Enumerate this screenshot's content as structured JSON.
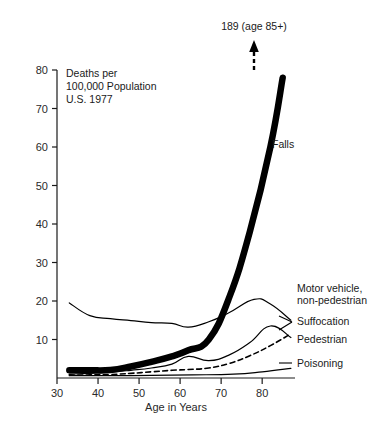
{
  "chart_data": {
    "type": "line",
    "title": "",
    "note_lines": [
      "Deaths  per",
      "100,000 Population",
      "U.S.  1977"
    ],
    "xlabel": "Age in Years",
    "ylabel": "",
    "xlim": [
      30,
      88
    ],
    "ylim": [
      0,
      80
    ],
    "xticks": [
      30,
      40,
      50,
      60,
      70,
      80
    ],
    "yticks": [
      10,
      20,
      30,
      40,
      50,
      60,
      70,
      80
    ],
    "grid": false,
    "legend_position": "right-inline",
    "annotations": [
      {
        "text": "189 (age 85+)",
        "x": 85,
        "y": 95,
        "kind": "arrow-callout"
      }
    ],
    "series": [
      {
        "name": "Falls",
        "style": "thick-solid",
        "label": "Falls",
        "x": [
          33,
          38,
          43,
          48,
          53,
          58,
          62,
          67,
          72,
          77,
          82,
          85
        ],
        "values": [
          2.0,
          2.0,
          2.1,
          3.0,
          4.2,
          5.6,
          7.2,
          10.0,
          21.0,
          38.0,
          60.0,
          78.0
        ]
      },
      {
        "name": "Motor vehicle, non-pedestrian",
        "style": "thin-solid",
        "label": "Motor vehicle,\nnon-pedestrian",
        "label_line1": "Motor  vehicle,",
        "label_line2": "non-pedestrian",
        "x": [
          33,
          38,
          43,
          48,
          53,
          58,
          62,
          67,
          72,
          78,
          82,
          87
        ],
        "values": [
          19.5,
          16.2,
          15.4,
          14.9,
          14.4,
          14.2,
          13.2,
          14.6,
          17.0,
          20.4,
          19.2,
          15.0
        ]
      },
      {
        "name": "Suffocation",
        "style": "thin-solid",
        "label": "Suffocation",
        "x": [
          33,
          38,
          43,
          48,
          53,
          58,
          62,
          67,
          72,
          77,
          82,
          87
        ],
        "values": [
          1.0,
          1.2,
          1.5,
          2.0,
          2.6,
          3.6,
          5.6,
          4.5,
          6.0,
          9.2,
          13.5,
          10.5
        ]
      },
      {
        "name": "Pedestrian",
        "style": "dashed",
        "label": "Pedestrian",
        "x": [
          33,
          38,
          43,
          48,
          53,
          58,
          62,
          67,
          72,
          77,
          82,
          87
        ],
        "values": [
          0.8,
          0.8,
          0.9,
          1.2,
          1.6,
          2.0,
          2.2,
          2.6,
          3.8,
          5.8,
          8.4,
          11.5
        ]
      },
      {
        "name": "Poisoning",
        "style": "thin-solid",
        "label": "Poisoning",
        "x": [
          33,
          43,
          53,
          63,
          73,
          80,
          87
        ],
        "values": [
          0.6,
          0.6,
          0.7,
          0.8,
          1.0,
          1.6,
          2.5
        ]
      }
    ]
  }
}
